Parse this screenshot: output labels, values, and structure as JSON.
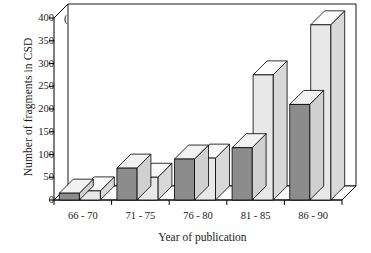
{
  "panel": {
    "label": "(a)"
  },
  "chart_data": {
    "type": "bar",
    "title": "",
    "subtitle": "",
    "xlabel": "Year of publication",
    "ylabel": "Number of fragments in CSD",
    "categories": [
      "66 - 70",
      "71 - 75",
      "76 - 80",
      "81 - 85",
      "86 - 90"
    ],
    "series": [
      {
        "name": "series-1",
        "values": [
          15,
          70,
          90,
          115,
          210
        ],
        "color": "#8c8c8c"
      },
      {
        "name": "series-2",
        "values": [
          20,
          50,
          92,
          275,
          385
        ],
        "color": "#e2e2e2"
      }
    ],
    "ylim": [
      0,
      400
    ],
    "yticks": [
      0,
      50,
      100,
      150,
      200,
      250,
      300,
      350,
      400
    ],
    "ytick_labels": [
      "0",
      "50",
      "100",
      "150",
      "200",
      "250",
      "300",
      "350",
      "400"
    ],
    "grid": false,
    "legend": "none",
    "style": "3d-extruded-bars",
    "annotations": [
      "(a)"
    ]
  },
  "colors": {
    "dark_bar": "#8c8c8c",
    "dark_bar_top": "#f2f2f2",
    "dark_bar_side": "#d0d0d0",
    "light_bar": "#e8e8e8",
    "light_bar_top": "#fbfbfb",
    "light_bar_side": "#d8d8d8",
    "axis": "#000000",
    "background": "#ffffff"
  }
}
